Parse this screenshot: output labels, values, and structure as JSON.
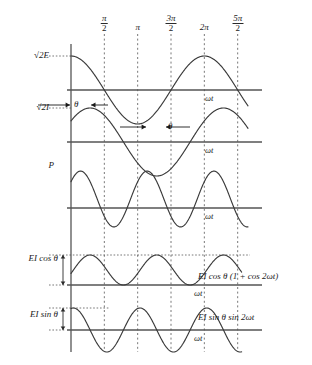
{
  "figure": {
    "background_color": "#ffffff",
    "curve_color": "#3a3a3a",
    "axis_color": "#555555",
    "grid_color": "#555555"
  },
  "xaxis": {
    "label": "ωt",
    "ticks": [
      {
        "id": "pi-over-2",
        "kind": "fraction",
        "num": "π",
        "den": "2",
        "x_rad": 1.5708
      },
      {
        "id": "pi",
        "kind": "plain",
        "text": "π",
        "x_rad": 3.1416
      },
      {
        "id": "3pi-over-2",
        "kind": "fraction",
        "num": "3π",
        "den": "2",
        "x_rad": 4.7124
      },
      {
        "id": "2pi",
        "kind": "plain",
        "text": "2π",
        "x_rad": 6.2832
      },
      {
        "id": "5pi-over-2",
        "kind": "fraction",
        "num": "5π",
        "den": "2",
        "x_rad": 7.854
      }
    ]
  },
  "panels": [
    {
      "id": "voltage",
      "left_label": "√2E",
      "axis_label": "ωt",
      "right_label": "",
      "equation": "e = √2 E cos ωt"
    },
    {
      "id": "current",
      "left_label": "√2I",
      "axis_label": "ωt",
      "right_label": "",
      "equation": "i = √2 I cos (ωt − θ)"
    },
    {
      "id": "power",
      "left_label": "P",
      "axis_label": "ωt",
      "right_label": "",
      "equation": "p = ei"
    },
    {
      "id": "real-power",
      "left_label": "EI cos θ",
      "axis_label": "ωt",
      "right_label": "EI cos θ (1 + cos 2ωt)",
      "equation": "EI cos θ (1 + cos 2ωt)"
    },
    {
      "id": "reactive-power",
      "left_label": "EI sin θ",
      "axis_label": "ωt",
      "right_label": "EI sin θ sin 2ωt",
      "equation": "EI sin θ sin 2ωt"
    }
  ],
  "annotations": [
    {
      "id": "theta-upper",
      "text": "θ",
      "meaning": "phase-lag-angle-between-voltage-and-current"
    },
    {
      "id": "theta-lower",
      "text": "θ",
      "meaning": "phase-lag-angle-between-voltage-and-current"
    }
  ],
  "chart_data": {
    "type": "line",
    "xlabel": "ωt",
    "ylabel": "",
    "xlim": [
      0,
      9.0
    ],
    "xticks": [
      1.5708,
      3.1416,
      4.7124,
      6.2832,
      7.854
    ],
    "xticklabels": [
      "π/2",
      "π",
      "3π/2",
      "2π",
      "5π/2"
    ],
    "grid": "vertical dashed at each tick",
    "legend": "none",
    "parameters": {
      "theta_rad": 0.9,
      "E_amp": 1.0,
      "I_amp": 1.0
    },
    "series": [
      {
        "name": "√2E",
        "panel": "voltage",
        "formula": "cos(wt)",
        "amplitude": 1.0,
        "phase_rad": 0.0,
        "freq_mult": 1
      },
      {
        "name": "√2I",
        "panel": "current",
        "formula": "cos(wt - theta)",
        "amplitude": 1.0,
        "phase_rad": 0.9,
        "freq_mult": 1
      },
      {
        "name": "P",
        "panel": "power",
        "formula": "cos(wt)*cos(wt-theta)",
        "amplitude": 1.0,
        "phase_rad": 0.45,
        "freq_mult": 2
      },
      {
        "name": "EI cos θ (1 + cos 2ωt)",
        "panel": "real-power",
        "formula": "EIcos(theta)*(1+cos(2wt))",
        "amplitude": 0.62,
        "phase_rad": 0.0,
        "freq_mult": 2
      },
      {
        "name": "EI sin θ sin 2ωt",
        "panel": "reactive-power",
        "formula": "EIsin(theta)*sin(2wt)",
        "amplitude": 0.78,
        "phase_rad": 0.0,
        "freq_mult": 2
      }
    ]
  }
}
